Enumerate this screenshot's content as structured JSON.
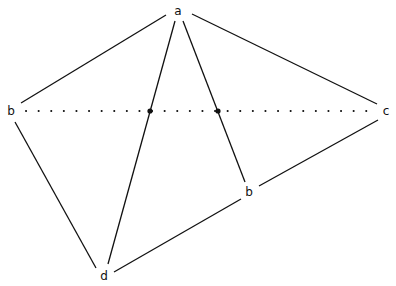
{
  "diagram": {
    "type": "geometric-graph",
    "stroke_color": "#111111",
    "background": "#ffffff",
    "nodes": [
      {
        "id": "a",
        "label": "a",
        "x": 178,
        "y": 11
      },
      {
        "id": "b1",
        "label": "b",
        "x": 11,
        "y": 111
      },
      {
        "id": "c",
        "label": "c",
        "x": 386,
        "y": 111
      },
      {
        "id": "b2",
        "label": "b",
        "x": 249,
        "y": 192
      },
      {
        "id": "d",
        "label": "d",
        "x": 104,
        "y": 276
      }
    ],
    "intersections": [
      {
        "id": "p1",
        "x": 150,
        "y": 111
      },
      {
        "id": "p2",
        "x": 218,
        "y": 111
      }
    ],
    "solid_edges": [
      {
        "from": "a",
        "to": "b1"
      },
      {
        "from": "a",
        "to": "c"
      },
      {
        "from": "a",
        "to": "d"
      },
      {
        "from": "a",
        "to": "b2"
      },
      {
        "from": "b1",
        "to": "d"
      },
      {
        "from": "d",
        "to": "b2"
      },
      {
        "from": "b2",
        "to": "c"
      }
    ],
    "dotted_edges": [
      {
        "from": "b1",
        "to": "c"
      }
    ]
  }
}
